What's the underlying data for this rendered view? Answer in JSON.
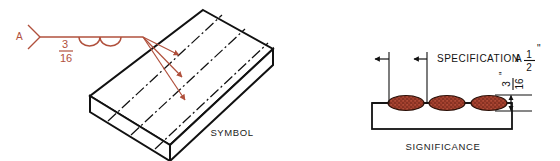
{
  "figure": {
    "panels": [
      {
        "id": "symbol",
        "caption": "SYMBOL"
      },
      {
        "id": "significance",
        "caption": "SIGNIFICANCE"
      }
    ]
  },
  "colors": {
    "weld_red": "#b0503c",
    "nugget_fill": "#a4402e",
    "nugget_speckle": "#6e2417",
    "line_black": "#111111",
    "background": "#ffffff"
  },
  "symbol_panel": {
    "caption": "SYMBOL",
    "tail_label": "A",
    "size_numerator": "3",
    "size_denominator": "16",
    "size_text": "3/16",
    "weld_symbol_name": "seam-weld-arcs",
    "arc_count": 2,
    "arrow_count": 3,
    "centerline_count": 3,
    "plate_name": "isometric-plate"
  },
  "significance_panel": {
    "caption": "SIGNIFICANCE",
    "spec_label": "SPECIFICATION",
    "spec_class": "A",
    "spec_numerator": "1",
    "spec_denominator": "2",
    "spec_inch_mark": "\"",
    "spec_text": "SPECIFICATION A 1/2\"",
    "height_numerator": "3",
    "height_denominator": "16",
    "height_inch_mark": "\"",
    "height_text": "3/16\"",
    "nugget_count": 3,
    "plate_name": "section-plate"
  }
}
